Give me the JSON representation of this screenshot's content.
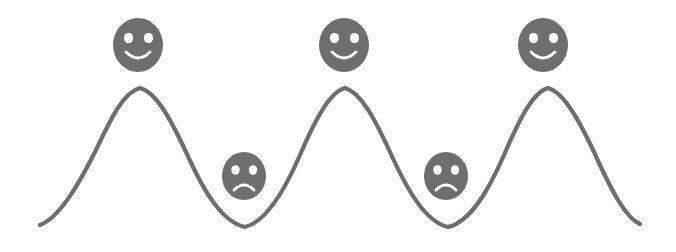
{
  "figure": {
    "title": "",
    "background_color": "#ffffff",
    "width": 676,
    "height": 252
  },
  "chart_data": {
    "type": "line",
    "title": "",
    "xlabel": "",
    "ylabel": "",
    "grid": false,
    "legend": false,
    "series": [
      {
        "name": "wave",
        "stroke_color": "#6e6e6e",
        "stroke_width": 4.2,
        "x_start": 40,
        "x_end": 640,
        "crest_y": 88,
        "trough_y": 227,
        "baseline_y": 225,
        "peaks_x": [
          140,
          345,
          548
        ],
        "troughs_x": [
          245,
          448
        ],
        "path": "M 40,225 C 58,218 76,190 96,150 C 112,116 124,92 140,88 C 156,92 170,118 186,152 C 204,192 222,222 245,227 C 266,222 284,192 300,155 C 316,118 330,92 345,88 C 360,92 374,117 390,152 C 408,192 426,222 448,227 C 470,222 488,192 504,155 C 520,118 533,92 548,88 C 563,92 578,118 594,152 C 612,192 626,218 640,224"
      }
    ]
  },
  "faces": {
    "fill_color": "#6e6e6e",
    "feature_color": "#ffffff",
    "happy": [
      {
        "id": "happy-face-1",
        "mood": "happy",
        "label": "Happy face above first crest",
        "cx": 138,
        "cy": 45,
        "rx": 25,
        "ry": 27
      },
      {
        "id": "happy-face-2",
        "mood": "happy",
        "label": "Happy face above second crest",
        "cx": 344,
        "cy": 45,
        "rx": 25,
        "ry": 27
      },
      {
        "id": "happy-face-3",
        "mood": "happy",
        "label": "Happy face above third crest",
        "cx": 543,
        "cy": 45,
        "rx": 25,
        "ry": 27
      }
    ],
    "sad": [
      {
        "id": "sad-face-1",
        "mood": "sad",
        "label": "Sad face inside first trough",
        "cx": 244,
        "cy": 176,
        "rx": 22,
        "ry": 24
      },
      {
        "id": "sad-face-2",
        "mood": "sad",
        "label": "Sad face inside second trough",
        "cx": 446,
        "cy": 176,
        "rx": 22,
        "ry": 24
      }
    ]
  },
  "accessibility": {
    "alt_text": "A gray sine wave drawn across a white background. Three smiling faces hover above the three wave crests and two frowning faces sit in the two wave troughs."
  }
}
